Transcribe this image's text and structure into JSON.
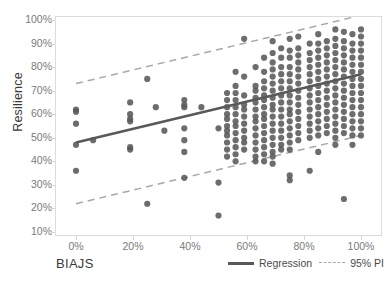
{
  "chart_data": {
    "type": "scatter",
    "title": "",
    "xlabel": "BIAJS",
    "ylabel": "Resilience",
    "xlim": [
      0,
      100
    ],
    "ylim": [
      10,
      100
    ],
    "grid": false,
    "x_ticks": [
      "0%",
      "20%",
      "40%",
      "60%",
      "80%",
      "100%"
    ],
    "x_tick_values": [
      0,
      20,
      40,
      60,
      80,
      100
    ],
    "y_ticks": [
      "10%",
      "20%",
      "30%",
      "40%",
      "50%",
      "60%",
      "70%",
      "80%",
      "90%",
      "100%"
    ],
    "y_tick_values": [
      10,
      20,
      30,
      40,
      50,
      60,
      70,
      80,
      90,
      100
    ],
    "legend_position": "bottom-right",
    "point_color": "#595959",
    "regression_color": "#595959",
    "pi_color": "#a8a8a8",
    "series": [
      {
        "name": "Observations",
        "type": "scatter",
        "points": [
          [
            0,
            62
          ],
          [
            0,
            61
          ],
          [
            0,
            56
          ],
          [
            0,
            47
          ],
          [
            0,
            36
          ],
          [
            6,
            49
          ],
          [
            19,
            65
          ],
          [
            19,
            60
          ],
          [
            19,
            58
          ],
          [
            19,
            57
          ],
          [
            19,
            46
          ],
          [
            19,
            45
          ],
          [
            25,
            75
          ],
          [
            25,
            22
          ],
          [
            28,
            63
          ],
          [
            31,
            53
          ],
          [
            38,
            66
          ],
          [
            38,
            64
          ],
          [
            38,
            63
          ],
          [
            38,
            54
          ],
          [
            38,
            49
          ],
          [
            38,
            44
          ],
          [
            38,
            33
          ],
          [
            44,
            63
          ],
          [
            50,
            54
          ],
          [
            50,
            31
          ],
          [
            50,
            17
          ],
          [
            53,
            69
          ],
          [
            53,
            66
          ],
          [
            53,
            63
          ],
          [
            53,
            60
          ],
          [
            53,
            58
          ],
          [
            53,
            55
          ],
          [
            53,
            53
          ],
          [
            53,
            51
          ],
          [
            53,
            48
          ],
          [
            53,
            45
          ],
          [
            53,
            42
          ],
          [
            56,
            78
          ],
          [
            56,
            72
          ],
          [
            56,
            69
          ],
          [
            56,
            66
          ],
          [
            56,
            63
          ],
          [
            56,
            60
          ],
          [
            56,
            57
          ],
          [
            56,
            55
          ],
          [
            56,
            52
          ],
          [
            56,
            49
          ],
          [
            56,
            46
          ],
          [
            56,
            43
          ],
          [
            56,
            40
          ],
          [
            59,
            92
          ],
          [
            59,
            76
          ],
          [
            59,
            68
          ],
          [
            59,
            64
          ],
          [
            59,
            62
          ],
          [
            59,
            59
          ],
          [
            59,
            56
          ],
          [
            59,
            53
          ],
          [
            59,
            50
          ],
          [
            59,
            48
          ],
          [
            59,
            45
          ],
          [
            63,
            80
          ],
          [
            63,
            72
          ],
          [
            63,
            70
          ],
          [
            63,
            67
          ],
          [
            63,
            65
          ],
          [
            63,
            62
          ],
          [
            63,
            59
          ],
          [
            63,
            57
          ],
          [
            63,
            54
          ],
          [
            63,
            51
          ],
          [
            63,
            48
          ],
          [
            63,
            45
          ],
          [
            63,
            42
          ],
          [
            63,
            40
          ],
          [
            66,
            84
          ],
          [
            66,
            78
          ],
          [
            66,
            74
          ],
          [
            66,
            71
          ],
          [
            66,
            68
          ],
          [
            66,
            66
          ],
          [
            66,
            63
          ],
          [
            66,
            60
          ],
          [
            66,
            58
          ],
          [
            66,
            55
          ],
          [
            66,
            52
          ],
          [
            66,
            49
          ],
          [
            66,
            46
          ],
          [
            66,
            43
          ],
          [
            66,
            40
          ],
          [
            69,
            91
          ],
          [
            69,
            86
          ],
          [
            69,
            82
          ],
          [
            69,
            79
          ],
          [
            69,
            76
          ],
          [
            69,
            73
          ],
          [
            69,
            70
          ],
          [
            69,
            67
          ],
          [
            69,
            64
          ],
          [
            69,
            62
          ],
          [
            69,
            59
          ],
          [
            69,
            56
          ],
          [
            69,
            53
          ],
          [
            69,
            50
          ],
          [
            69,
            47
          ],
          [
            69,
            44
          ],
          [
            69,
            42
          ],
          [
            69,
            39
          ],
          [
            72,
            88
          ],
          [
            72,
            84
          ],
          [
            72,
            80
          ],
          [
            72,
            77
          ],
          [
            72,
            74
          ],
          [
            72,
            71
          ],
          [
            72,
            68
          ],
          [
            72,
            65
          ],
          [
            72,
            62
          ],
          [
            72,
            59
          ],
          [
            72,
            56
          ],
          [
            72,
            53
          ],
          [
            72,
            50
          ],
          [
            72,
            47
          ],
          [
            72,
            45
          ],
          [
            75,
            92
          ],
          [
            75,
            87
          ],
          [
            75,
            84
          ],
          [
            75,
            80
          ],
          [
            75,
            77
          ],
          [
            75,
            74
          ],
          [
            75,
            71
          ],
          [
            75,
            68
          ],
          [
            75,
            65
          ],
          [
            75,
            62
          ],
          [
            75,
            60
          ],
          [
            75,
            57
          ],
          [
            75,
            54
          ],
          [
            75,
            51
          ],
          [
            75,
            48
          ],
          [
            75,
            45
          ],
          [
            75,
            34
          ],
          [
            75,
            32
          ],
          [
            78,
            93
          ],
          [
            78,
            88
          ],
          [
            78,
            85
          ],
          [
            78,
            82
          ],
          [
            78,
            79
          ],
          [
            78,
            76
          ],
          [
            78,
            73
          ],
          [
            78,
            70
          ],
          [
            78,
            67
          ],
          [
            78,
            64
          ],
          [
            78,
            61
          ],
          [
            78,
            58
          ],
          [
            78,
            55
          ],
          [
            78,
            52
          ],
          [
            78,
            49
          ],
          [
            82,
            90
          ],
          [
            82,
            86
          ],
          [
            82,
            83
          ],
          [
            82,
            80
          ],
          [
            82,
            77
          ],
          [
            82,
            74
          ],
          [
            82,
            71
          ],
          [
            82,
            68
          ],
          [
            82,
            65
          ],
          [
            82,
            62
          ],
          [
            82,
            59
          ],
          [
            82,
            56
          ],
          [
            82,
            53
          ],
          [
            82,
            50
          ],
          [
            82,
            36
          ],
          [
            85,
            94
          ],
          [
            85,
            90
          ],
          [
            85,
            87
          ],
          [
            85,
            84
          ],
          [
            85,
            81
          ],
          [
            85,
            78
          ],
          [
            85,
            75
          ],
          [
            85,
            72
          ],
          [
            85,
            69
          ],
          [
            85,
            66
          ],
          [
            85,
            63
          ],
          [
            85,
            60
          ],
          [
            85,
            57
          ],
          [
            85,
            54
          ],
          [
            85,
            51
          ],
          [
            85,
            44
          ],
          [
            88,
            91
          ],
          [
            88,
            88
          ],
          [
            88,
            85
          ],
          [
            88,
            82
          ],
          [
            88,
            79
          ],
          [
            88,
            76
          ],
          [
            88,
            73
          ],
          [
            88,
            70
          ],
          [
            88,
            67
          ],
          [
            88,
            64
          ],
          [
            88,
            61
          ],
          [
            88,
            58
          ],
          [
            88,
            55
          ],
          [
            88,
            52
          ],
          [
            91,
            96
          ],
          [
            91,
            92
          ],
          [
            91,
            89
          ],
          [
            91,
            86
          ],
          [
            91,
            83
          ],
          [
            91,
            80
          ],
          [
            91,
            77
          ],
          [
            91,
            74
          ],
          [
            91,
            71
          ],
          [
            91,
            68
          ],
          [
            91,
            65
          ],
          [
            91,
            62
          ],
          [
            91,
            59
          ],
          [
            91,
            56
          ],
          [
            91,
            53
          ],
          [
            91,
            50
          ],
          [
            91,
            47
          ],
          [
            94,
            95
          ],
          [
            94,
            91
          ],
          [
            94,
            88
          ],
          [
            94,
            85
          ],
          [
            94,
            82
          ],
          [
            94,
            79
          ],
          [
            94,
            76
          ],
          [
            94,
            73
          ],
          [
            94,
            70
          ],
          [
            94,
            67
          ],
          [
            94,
            64
          ],
          [
            94,
            61
          ],
          [
            94,
            58
          ],
          [
            94,
            55
          ],
          [
            94,
            52
          ],
          [
            94,
            24
          ],
          [
            97,
            94
          ],
          [
            97,
            90
          ],
          [
            97,
            87
          ],
          [
            97,
            84
          ],
          [
            97,
            81
          ],
          [
            97,
            78
          ],
          [
            97,
            75
          ],
          [
            97,
            72
          ],
          [
            97,
            69
          ],
          [
            97,
            66
          ],
          [
            97,
            63
          ],
          [
            97,
            60
          ],
          [
            97,
            57
          ],
          [
            97,
            54
          ],
          [
            97,
            51
          ],
          [
            97,
            47
          ],
          [
            100,
            96
          ],
          [
            100,
            93
          ],
          [
            100,
            90
          ],
          [
            100,
            87
          ],
          [
            100,
            84
          ],
          [
            100,
            81
          ],
          [
            100,
            78
          ],
          [
            100,
            75
          ],
          [
            100,
            72
          ],
          [
            100,
            69
          ],
          [
            100,
            66
          ],
          [
            100,
            63
          ],
          [
            100,
            60
          ],
          [
            100,
            57
          ],
          [
            100,
            54
          ],
          [
            100,
            51
          ]
        ]
      },
      {
        "name": "Regression",
        "type": "line",
        "style": "solid",
        "endpoints": [
          [
            0,
            48
          ],
          [
            100,
            77
          ]
        ]
      },
      {
        "name": "95% PI",
        "type": "line",
        "style": "dashed",
        "upper_endpoints": [
          [
            0,
            73
          ],
          [
            100,
            102
          ]
        ],
        "lower_endpoints": [
          [
            0,
            22
          ],
          [
            100,
            51
          ]
        ]
      }
    ]
  },
  "legend": {
    "regression_label": "Regression",
    "pi_label": "95% PI"
  }
}
